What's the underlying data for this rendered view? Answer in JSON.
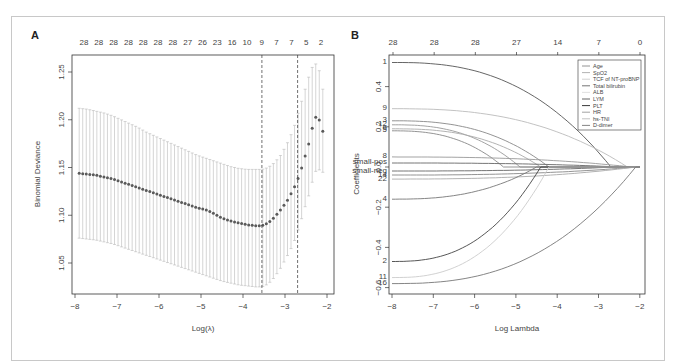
{
  "figure": {
    "panels": [
      "A",
      "B"
    ]
  },
  "chart_data": [
    {
      "panel": "A",
      "type": "scatter",
      "subtype": "cross-validation curve with error bars",
      "title": "",
      "xlabel": "Log(λ)",
      "ylabel": "Binomial Deviance",
      "xlim": [
        -8,
        -2
      ],
      "ylim": [
        1.02,
        1.27
      ],
      "x_ticks": [
        "-8",
        "-7",
        "-6",
        "-5",
        "-4",
        "-3",
        "-2"
      ],
      "y_ticks": [
        "1.05",
        "1.10",
        "1.15",
        "1.20",
        "1.25"
      ],
      "top_axis_labels": [
        "28",
        "28",
        "28",
        "28",
        "28",
        "28",
        "28",
        "27",
        "26",
        "23",
        "16",
        "10",
        "9",
        "7",
        "7",
        "5",
        "2"
      ],
      "vertical_lines": [
        {
          "name": "lambda.min",
          "x": -3.55
        },
        {
          "name": "lambda.1se",
          "x": -2.7
        }
      ],
      "series": [
        {
          "name": "mean deviance",
          "x": [
            -7.9,
            -7.7,
            -7.5,
            -7.3,
            -7.1,
            -6.9,
            -6.7,
            -6.5,
            -6.3,
            -6.1,
            -5.9,
            -5.7,
            -5.5,
            -5.3,
            -5.1,
            -4.9,
            -4.7,
            -4.5,
            -4.3,
            -4.1,
            -3.9,
            -3.7,
            -3.55,
            -3.4,
            -3.25,
            -3.1,
            -2.95,
            -2.8,
            -2.7,
            -2.6,
            -2.5,
            -2.4,
            -2.3,
            -2.2,
            -2.1
          ],
          "values": [
            1.144,
            1.143,
            1.142,
            1.14,
            1.138,
            1.135,
            1.132,
            1.129,
            1.126,
            1.123,
            1.12,
            1.117,
            1.114,
            1.111,
            1.108,
            1.106,
            1.102,
            1.097,
            1.094,
            1.092,
            1.09,
            1.089,
            1.089,
            1.092,
            1.098,
            1.106,
            1.115,
            1.127,
            1.137,
            1.15,
            1.165,
            1.18,
            1.203,
            1.202,
            1.188
          ],
          "upper": [
            1.212,
            1.211,
            1.209,
            1.207,
            1.204,
            1.2,
            1.196,
            1.192,
            1.187,
            1.183,
            1.179,
            1.175,
            1.171,
            1.167,
            1.163,
            1.16,
            1.157,
            1.154,
            1.151,
            1.149,
            1.148,
            1.148,
            1.148,
            1.15,
            1.155,
            1.163,
            1.175,
            1.19,
            1.205,
            1.22,
            1.235,
            1.25,
            1.26,
            1.255,
            1.232
          ],
          "lower": [
            1.076,
            1.075,
            1.074,
            1.072,
            1.07,
            1.067,
            1.064,
            1.061,
            1.058,
            1.055,
            1.052,
            1.049,
            1.046,
            1.043,
            1.04,
            1.037,
            1.034,
            1.031,
            1.029,
            1.027,
            1.026,
            1.025,
            1.025,
            1.028,
            1.035,
            1.045,
            1.057,
            1.07,
            1.083,
            1.097,
            1.112,
            1.125,
            1.145,
            1.148,
            1.145
          ]
        }
      ],
      "grid": false
    },
    {
      "panel": "B",
      "type": "line",
      "subtype": "lasso coefficient paths",
      "title": "",
      "xlabel": "Log Lambda",
      "ylabel": "Coefficients",
      "xlim": [
        -8,
        -2
      ],
      "ylim": [
        -0.6,
        0.55
      ],
      "x_ticks": [
        "-8",
        "-7",
        "-6",
        "-5",
        "-4",
        "-3",
        "-2"
      ],
      "y_ticks": [
        "-0.6",
        "-0.4",
        "-0.2",
        "0.0",
        "0.2",
        "0.4"
      ],
      "top_axis_labels": [
        "28",
        "28",
        "28",
        "27",
        "14",
        "7",
        "0"
      ],
      "legend": {
        "position": "top-right",
        "entries": [
          "Age",
          "SpO2",
          "TCF of NT-proBNP",
          "Total bilirubin",
          "ALB",
          "LYM",
          "PLT",
          "HR",
          "hs-TNI",
          "D-dimer"
        ]
      },
      "series": [
        {
          "name": "path-1",
          "start": 0.52,
          "zero_at": -2.7,
          "shade": "#555555"
        },
        {
          "name": "path-9",
          "start": 0.29,
          "zero_at": -2.3,
          "shade": "#bbbbbb"
        },
        {
          "name": "path-3",
          "start": 0.23,
          "zero_at": -4.2,
          "shade": "#888888"
        },
        {
          "name": "path-12",
          "start": 0.21,
          "zero_at": -4.9,
          "shade": "#999999"
        },
        {
          "name": "path-6",
          "start": 0.19,
          "zero_at": -4.4,
          "shade": "#aaaaaa"
        },
        {
          "name": "path-5",
          "start": 0.18,
          "zero_at": -5.3,
          "shade": "#888888"
        },
        {
          "name": "path-8",
          "start": 0.05,
          "zero_at": -2.2,
          "shade": "#999999"
        },
        {
          "name": "path-small-pos",
          "start": 0.02,
          "zero_at": -2.5,
          "shade": "#666666"
        },
        {
          "name": "path-small-neg",
          "start": -0.02,
          "zero_at": -2.6,
          "shade": "#666666"
        },
        {
          "name": "path-14",
          "start": -0.04,
          "zero_at": -2.1,
          "shade": "#888888"
        },
        {
          "name": "path-22",
          "start": -0.06,
          "zero_at": -2.1,
          "shade": "#aaaaaa"
        },
        {
          "name": "path-4",
          "start": -0.16,
          "zero_at": -4.5,
          "shade": "#777777"
        },
        {
          "name": "path-2",
          "start": -0.47,
          "zero_at": -4.4,
          "shade": "#444444"
        },
        {
          "name": "path-11",
          "start": -0.55,
          "zero_at": -4.2,
          "shade": "#cccccc"
        },
        {
          "name": "path-16",
          "start": -0.58,
          "zero_at": -2.1,
          "shade": "#777777"
        }
      ],
      "grid": false
    }
  ]
}
